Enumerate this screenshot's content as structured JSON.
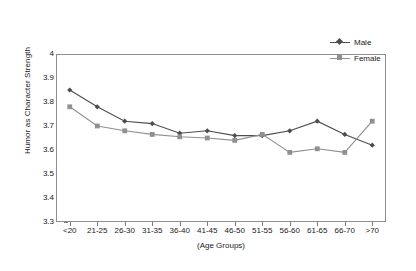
{
  "chart_data": {
    "type": "line",
    "title": "",
    "xlabel": "(Age Groups)",
    "ylabel": "Humor as Character Strength",
    "categories": [
      "<20",
      "21-25",
      "26-30",
      "31-35",
      "36-40",
      "41-45",
      "46-50",
      "51-55",
      "56-60",
      "61-65",
      "66-70",
      ">70"
    ],
    "ylim": [
      3.3,
      4.0
    ],
    "yticks": [
      "4",
      "3.9",
      "3.8",
      "3.7",
      "3.6",
      "3.5",
      "3.4",
      "3.3"
    ],
    "ytick_values": [
      4.0,
      3.9,
      3.8,
      3.7,
      3.6,
      3.5,
      3.4,
      3.3
    ],
    "grid": false,
    "legend_position": "top-right",
    "series": [
      {
        "name": "Male",
        "color": "#4d4d4d",
        "marker": "diamond",
        "values": [
          3.85,
          3.78,
          3.72,
          3.71,
          3.67,
          3.68,
          3.66,
          3.66,
          3.68,
          3.72,
          3.665,
          3.62
        ]
      },
      {
        "name": "Female",
        "color": "#909090",
        "marker": "square",
        "values": [
          3.78,
          3.7,
          3.68,
          3.665,
          3.655,
          3.65,
          3.64,
          3.665,
          3.59,
          3.605,
          3.59,
          3.72
        ]
      }
    ]
  },
  "legend": {
    "items": [
      {
        "label": "Male"
      },
      {
        "label": "Female"
      }
    ]
  }
}
